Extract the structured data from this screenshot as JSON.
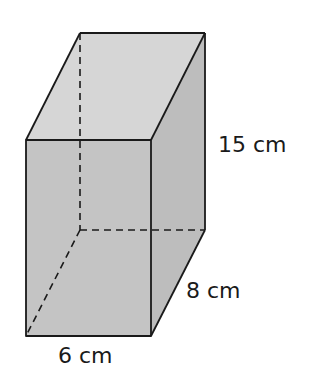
{
  "diagram": {
    "type": "rectangular-prism",
    "colors": {
      "edge": "#1a1a1a",
      "top_face": "#d6d6d6",
      "front_face": "#c4c4c4",
      "side_face": "#bdbdbd",
      "background": "#ffffff"
    },
    "labels": {
      "height": "15 cm",
      "depth": "8 cm",
      "width": "6 cm"
    },
    "dimensions": {
      "width_cm": 6,
      "depth_cm": 8,
      "height_cm": 15
    }
  }
}
